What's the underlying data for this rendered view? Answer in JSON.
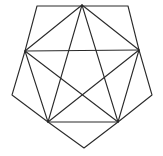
{
  "diagram": {
    "title": "",
    "stroke_color": "#2a2a2a",
    "background": "#ffffff",
    "points": {
      "A": [
        82,
        5
      ],
      "B": [
        37,
        6
      ],
      "C": [
        128,
        6
      ],
      "D": [
        25,
        51
      ],
      "E": [
        139,
        50
      ],
      "F": [
        12,
        95
      ],
      "G": [
        152,
        95
      ],
      "H": [
        48,
        122
      ],
      "I": [
        118,
        122
      ],
      "J": [
        84,
        148
      ]
    },
    "outer_polygon": [
      "B",
      "C",
      "E",
      "G",
      "I",
      "J",
      "H",
      "F",
      "D"
    ],
    "edges": [
      [
        "A",
        "D"
      ],
      [
        "A",
        "E"
      ],
      [
        "A",
        "H"
      ],
      [
        "A",
        "I"
      ],
      [
        "D",
        "E"
      ],
      [
        "D",
        "H"
      ],
      [
        "D",
        "I"
      ],
      [
        "E",
        "H"
      ],
      [
        "E",
        "I"
      ],
      [
        "H",
        "I"
      ]
    ]
  }
}
